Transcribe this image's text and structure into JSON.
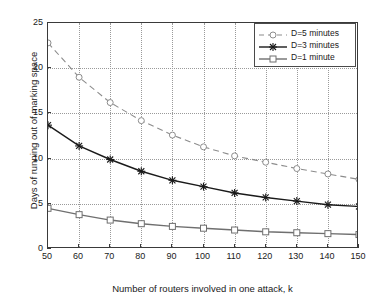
{
  "chart_data": {
    "type": "line",
    "title": "",
    "xlabel": "Number of routers involved in one attack, k",
    "ylabel": "Days of running out of marking space",
    "x": [
      50,
      60,
      70,
      80,
      90,
      100,
      110,
      120,
      130,
      140,
      150
    ],
    "xlim": [
      50,
      150
    ],
    "ylim": [
      0,
      25
    ],
    "xticks": [
      "50",
      "60",
      "70",
      "80",
      "90",
      "100",
      "110",
      "120",
      "130",
      "140",
      "150"
    ],
    "yticks": [
      "0",
      "5",
      "10",
      "15",
      "20",
      "25"
    ],
    "grid": true,
    "legend_position": "top-right",
    "series": [
      {
        "name": "D=5 minutes",
        "values": [
          22.8,
          19.0,
          16.2,
          14.2,
          12.6,
          11.3,
          10.3,
          9.6,
          8.9,
          8.3,
          7.7
        ],
        "color": "#8c8c8c",
        "linestyle": "dashed",
        "marker": "circle"
      },
      {
        "name": "D=3 minutes",
        "values": [
          13.7,
          11.4,
          9.9,
          8.6,
          7.6,
          6.9,
          6.2,
          5.7,
          5.3,
          4.9,
          4.7
        ],
        "color": "#1a1a1a",
        "linestyle": "solid",
        "marker": "star"
      },
      {
        "name": "D=1 minute",
        "values": [
          4.5,
          3.8,
          3.2,
          2.8,
          2.5,
          2.3,
          2.1,
          1.9,
          1.8,
          1.7,
          1.6
        ],
        "color": "#6f6f6f",
        "linestyle": "solid",
        "marker": "square"
      }
    ]
  },
  "legend": {
    "items": [
      {
        "label": "D=5 minutes"
      },
      {
        "label": "D=3 minutes"
      },
      {
        "label": "D=1 minute"
      }
    ]
  }
}
